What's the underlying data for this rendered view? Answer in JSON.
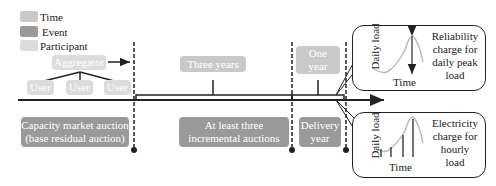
{
  "legend": {
    "items": [
      {
        "label": "Time",
        "color": "#c9c9c9"
      },
      {
        "label": "Event",
        "color": "#9a9a9a"
      },
      {
        "label": "Participant",
        "color": "#dcdcdc"
      }
    ]
  },
  "participants": {
    "aggregator": "Aggregator",
    "users": [
      "User",
      "User",
      "User"
    ]
  },
  "time_boxes": {
    "three_years": "Three years",
    "one_year_line1": "One",
    "one_year_line2": "year"
  },
  "events": {
    "capacity_line1": "Capacity market auction",
    "capacity_line2": "(base residual auction)",
    "incremental_line1": "At least three",
    "incremental_line2": "incremental auctions",
    "delivery_line1": "Delivery",
    "delivery_line2": "year"
  },
  "panels": {
    "top": {
      "ylabel": "Daily load",
      "xlabel": "Time",
      "text": [
        "Reliability",
        "charge for",
        "daily peak",
        "load"
      ]
    },
    "bottom": {
      "ylabel": "Daily load",
      "xlabel": "Time",
      "text": [
        "Electricity",
        "charge for",
        "hourly",
        "load"
      ]
    }
  }
}
